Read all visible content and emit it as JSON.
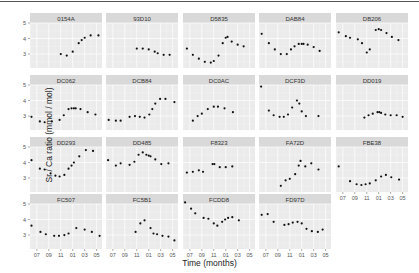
{
  "chart_data": {
    "type": "scatter",
    "layout": "faceted",
    "facet_rows": 4,
    "facet_cols": 5,
    "title": "",
    "xlabel": "Time (months)",
    "ylabel": "Sr / Ca ratio (mmol / mol)",
    "x_ticks": [
      7,
      9,
      11,
      13,
      15,
      17
    ],
    "x_tick_labels": [
      "07",
      "09",
      "11",
      "01",
      "03",
      "05"
    ],
    "xlim": [
      5.85,
      17.9
    ],
    "y_ticks": [
      3,
      4,
      5
    ],
    "y_tick_labels": [
      "3",
      "4",
      "5"
    ],
    "ylim": [
      2.1,
      5.0
    ],
    "grid": true,
    "legend": "none",
    "panels": [
      {
        "name": "0154A",
        "x": [
          11,
          12,
          13,
          14,
          14.5,
          15,
          16,
          17.3
        ],
        "y": [
          3.0,
          2.9,
          3.15,
          3.7,
          3.9,
          4.05,
          4.2,
          4.2
        ]
      },
      {
        "name": "93D10",
        "x": [
          11,
          12,
          13,
          14,
          14.5,
          15.5,
          16.5
        ],
        "y": [
          3.35,
          3.35,
          3.3,
          3.15,
          3.05,
          2.95,
          2.95
        ]
      },
      {
        "name": "D5835",
        "x": [
          6.5,
          7.5,
          8.5,
          9.5,
          10.5,
          11,
          11.8,
          12.5,
          13,
          13.3,
          14,
          15,
          16
        ],
        "y": [
          3.35,
          2.95,
          2.7,
          2.5,
          2.45,
          2.55,
          2.9,
          3.7,
          4.05,
          4.1,
          3.8,
          3.6,
          3.5
        ]
      },
      {
        "name": "DAB84",
        "x": [
          6.3,
          7.5,
          8.5,
          9.5,
          10.5,
          11.2,
          11.8,
          12.5,
          13,
          13.3,
          14,
          15,
          16
        ],
        "y": [
          4.3,
          3.7,
          3.3,
          3.0,
          3.0,
          3.3,
          3.5,
          3.65,
          3.65,
          3.65,
          3.6,
          3.45,
          3.2
        ]
      },
      {
        "name": "DB206",
        "x": [
          6.3,
          7.5,
          8.2,
          9.5,
          10.2,
          11,
          11.5,
          12.5,
          13,
          13.4,
          14.3,
          15.2,
          16.3
        ],
        "y": [
          4.4,
          4.15,
          4.05,
          3.95,
          3.7,
          3.1,
          3.3,
          4.55,
          4.6,
          4.55,
          4.35,
          4.1,
          3.9
        ]
      },
      {
        "name": "DC062",
        "x": [
          6.1,
          7.5,
          8.3,
          9.5,
          10.8,
          11.5,
          12.3,
          12.8,
          13.2,
          13.5,
          14.3,
          15.5,
          16.8
        ],
        "y": [
          2.95,
          2.65,
          2.6,
          2.65,
          2.75,
          3.05,
          3.45,
          3.5,
          3.5,
          3.5,
          3.45,
          3.25,
          3.1
        ]
      },
      {
        "name": "DCB84",
        "x": [
          6.3,
          7.5,
          8.3,
          9.8,
          10.7,
          11.5,
          12.3,
          13.1,
          13.6,
          14.1,
          14.9,
          15.8,
          17.3
        ],
        "y": [
          2.75,
          2.7,
          2.7,
          2.95,
          3.0,
          2.95,
          2.9,
          3.1,
          3.45,
          3.8,
          4.1,
          4.1,
          3.9
        ]
      },
      {
        "name": "DC0AC",
        "x": [
          7.5,
          8.3,
          9,
          10,
          11,
          11.7,
          12.8,
          14.2
        ],
        "y": [
          2.7,
          3.0,
          3.15,
          3.45,
          3.6,
          3.6,
          3.5,
          3.25
        ]
      },
      {
        "name": "DCF3D",
        "x": [
          6.2,
          7.5,
          8.3,
          9.3,
          10,
          10.7,
          11.4,
          12.2,
          12.6,
          13,
          13.7,
          15.8
        ],
        "y": [
          4.9,
          3.35,
          3.05,
          2.95,
          2.95,
          3.1,
          3.55,
          4.0,
          3.8,
          3.3,
          3.0,
          3.0
        ]
      },
      {
        "name": "DD019",
        "x": [
          10.6,
          11.3,
          12,
          12.8,
          13.1,
          13.4,
          14.1,
          15,
          16,
          17
        ],
        "y": [
          2.9,
          3.05,
          3.15,
          3.25,
          3.25,
          3.2,
          3.1,
          3.05,
          3.05,
          2.95
        ]
      },
      {
        "name": "DD293",
        "x": [
          6.1,
          7.5,
          8.3,
          9.3,
          10.1,
          10.8,
          11.6,
          12.3,
          12.8,
          13.2,
          14.1,
          15.2,
          16.4
        ],
        "y": [
          4.15,
          3.6,
          3.55,
          3.3,
          3.15,
          3.1,
          3.2,
          3.6,
          3.8,
          4.0,
          4.4,
          4.8,
          4.75
        ]
      },
      {
        "name": "DD485",
        "x": [
          6.2,
          7.5,
          8.3,
          9.8,
          10.6,
          11.3,
          12,
          12.6,
          13,
          13.3,
          14.1,
          15.1,
          16.3
        ],
        "y": [
          4.15,
          3.8,
          3.95,
          3.85,
          4.05,
          4.5,
          4.65,
          4.5,
          4.45,
          4.4,
          4.2,
          3.9,
          3.95
        ]
      },
      {
        "name": "F8323",
        "x": [
          6.5,
          7.5,
          8.5,
          9.2,
          10.8,
          11.1,
          12,
          13,
          14.1
        ],
        "y": [
          3.35,
          3.4,
          3.5,
          3.4,
          3.9,
          3.9,
          3.7,
          3.7,
          3.75
        ]
      },
      {
        "name": "FA72D",
        "x": [
          9.5,
          10.3,
          11,
          11.9,
          12.5,
          12.8,
          13.6,
          14.6,
          15.8
        ],
        "y": [
          2.5,
          2.85,
          2.95,
          3.25,
          3.8,
          4.1,
          3.75,
          3.95,
          3.55
        ]
      },
      {
        "name": "FBE38",
        "x": [
          6.3,
          8.2,
          9.3,
          10.1,
          10.8,
          11.5,
          12.5,
          13.4,
          14.2,
          15.1,
          16.4
        ],
        "y": [
          3.75,
          2.8,
          2.6,
          2.55,
          2.6,
          2.65,
          2.85,
          3.1,
          3.2,
          3.05,
          2.9
        ]
      },
      {
        "name": "FC507",
        "x": [
          6.1,
          7.6,
          8.5,
          9.9,
          10.7,
          11.6,
          12.3,
          13.6,
          15,
          16.2,
          17.5
        ],
        "y": [
          3.6,
          3.2,
          3.05,
          2.95,
          2.95,
          3.0,
          3.1,
          3.45,
          3.35,
          3.2,
          2.95
        ]
      },
      {
        "name": "FC5B1",
        "x": [
          10.8,
          11.6,
          12.3,
          13.3,
          13.8,
          14.4,
          15.3,
          16.3,
          17.3
        ],
        "y": [
          3.2,
          3.75,
          3.95,
          3.45,
          3.1,
          3.05,
          2.95,
          2.9,
          2.65
        ]
      },
      {
        "name": "FCDD8",
        "x": [
          6.2,
          7.2,
          7.9,
          9.3,
          10.1,
          11,
          11.6,
          12.4,
          12.9,
          13.4,
          14.1,
          15.2
        ],
        "y": [
          5.1,
          4.7,
          4.4,
          4.1,
          4.05,
          3.75,
          3.6,
          3.85,
          4.0,
          4.1,
          4.15,
          3.95
        ]
      },
      {
        "name": "FD97D",
        "x": [
          6.3,
          7.3,
          8.3,
          10.1,
          10.8,
          11.5,
          12.3,
          13,
          13.8,
          14.7,
          15.7,
          16.5
        ],
        "y": [
          4.3,
          4.35,
          3.85,
          3.65,
          3.7,
          3.8,
          3.85,
          3.75,
          3.4,
          3.25,
          3.2,
          3.35
        ]
      }
    ]
  },
  "axis": {
    "xlabel": "Time (months)",
    "ylabel": "Sr / Ca ratio (mmol / mol)"
  },
  "colors": {
    "panel_bg": "#ebebeb",
    "strip_bg": "#d9d9d9",
    "grid_major": "#ffffff",
    "grid_minor": "#f5f5f5",
    "point": "#111111",
    "text": "#333333"
  }
}
